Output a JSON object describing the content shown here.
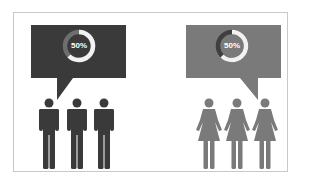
{
  "panels": [
    {
      "group": "men",
      "bubble_color": "#3a3a3a",
      "ring_track_color": "#6e6e6e",
      "ring_fill_color": "#f2f2f2",
      "percent_label": "50%",
      "percent_value": 50,
      "figure_color": "#3a3a3a",
      "figure_icon": "male-person-icon",
      "figure_count": 3
    },
    {
      "group": "women",
      "bubble_color": "#7a7a7a",
      "ring_track_color": "#3f3f3f",
      "ring_fill_color": "#f2f2f2",
      "percent_label": "50%",
      "percent_value": 50,
      "figure_color": "#7a7a7a",
      "figure_icon": "female-person-icon",
      "figure_count": 3
    }
  ]
}
